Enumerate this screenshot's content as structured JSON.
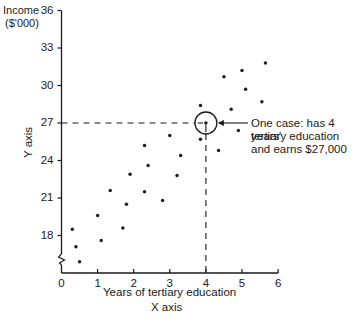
{
  "chart_data": {
    "type": "scatter",
    "title": "",
    "xlabel": "Years of tertiary education",
    "xlabel_secondary": "X axis",
    "ylabel": "Income ($'000)",
    "ylabel_secondary": "Y axis",
    "xlim": [
      0,
      6
    ],
    "ylim": [
      15,
      36
    ],
    "x_ticks": [
      "0",
      "1",
      "2",
      "3",
      "4",
      "5",
      "6"
    ],
    "y_ticks": [
      "18",
      "21",
      "24",
      "27",
      "30",
      "33",
      "36"
    ],
    "y_axis_break": true,
    "grid": false,
    "legend": null,
    "series": [
      {
        "name": "cases",
        "points": [
          [
            0.5,
            15.9
          ],
          [
            0.4,
            17.1
          ],
          [
            0.3,
            18.5
          ],
          [
            1.1,
            17.6
          ],
          [
            1.0,
            19.6
          ],
          [
            1.7,
            18.6
          ],
          [
            1.35,
            21.6
          ],
          [
            1.8,
            20.5
          ],
          [
            1.9,
            22.9
          ],
          [
            2.3,
            21.5
          ],
          [
            2.3,
            25.2
          ],
          [
            2.4,
            23.6
          ],
          [
            2.8,
            20.8
          ],
          [
            3.0,
            26.0
          ],
          [
            3.2,
            22.8
          ],
          [
            3.3,
            24.4
          ],
          [
            3.85,
            28.4
          ],
          [
            3.85,
            25.7
          ],
          [
            4.0,
            27.0
          ],
          [
            4.35,
            24.8
          ],
          [
            4.5,
            30.7
          ],
          [
            4.7,
            28.1
          ],
          [
            4.9,
            26.4
          ],
          [
            5.0,
            31.2
          ],
          [
            5.1,
            29.7
          ],
          [
            5.55,
            28.7
          ],
          [
            5.65,
            31.8
          ]
        ]
      }
    ],
    "highlight": {
      "x": 4,
      "y": 27
    },
    "annotations": [
      "One case: has 4 years'",
      "tertiary education",
      "and earns $27,000"
    ]
  },
  "labels": {
    "y_title_line1": "Income",
    "y_title_line2": "($'000)",
    "y_axis": "Y axis",
    "x_title": "Years of tertiary education",
    "x_axis": "X axis"
  },
  "colors": {
    "ink": "#1a1a1a",
    "background": "#ffffff"
  }
}
